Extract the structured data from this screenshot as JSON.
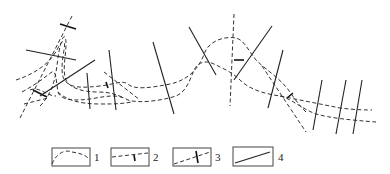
{
  "diagram": {
    "legend": [
      {
        "id": "1",
        "label": "1",
        "symbol": "dashed-curve"
      },
      {
        "id": "2",
        "label": "2",
        "symbol": "dashed-line-with-tick"
      },
      {
        "id": "3",
        "label": "3",
        "symbol": "dashed-line-with-cross-tick"
      },
      {
        "id": "4",
        "label": "4",
        "symbol": "solid-line"
      }
    ]
  }
}
